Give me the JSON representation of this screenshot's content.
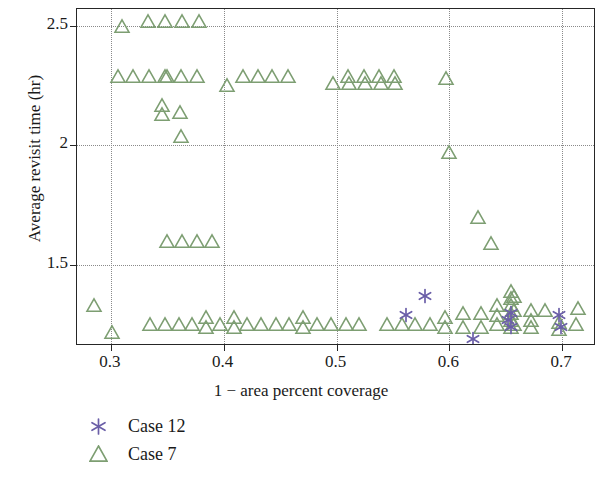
{
  "chart_data": {
    "type": "scatter",
    "title": "",
    "xlabel": "1 − area percent coverage",
    "ylabel": "Average revisit time (hr)",
    "xlim": [
      0.27,
      0.73
    ],
    "ylim": [
      1.16,
      2.57
    ],
    "xticks": [
      "0.3",
      "0.4",
      "0.5",
      "0.6",
      "0.7"
    ],
    "xtick_values": [
      0.3,
      0.4,
      0.5,
      0.6,
      0.7
    ],
    "yticks": [
      "1.5",
      "2",
      "2.5"
    ],
    "ytick_values": [
      1.5,
      2.0,
      2.5
    ],
    "grid": true,
    "grid_style": "dotted",
    "legend_position": "below-left",
    "colors": {
      "case12": "#6b5fa8",
      "case7": "#7d9e72",
      "axis": "#262626",
      "grid": "#8a8a8a"
    },
    "series": [
      {
        "name": "Case 12",
        "marker": "asterisk",
        "color": "#6b5fa8",
        "points": [
          [
            0.562,
            1.29
          ],
          [
            0.578,
            1.37
          ],
          [
            0.621,
            1.19
          ],
          [
            0.652,
            1.27
          ],
          [
            0.655,
            1.24
          ],
          [
            0.655,
            1.3
          ],
          [
            0.697,
            1.29
          ],
          [
            0.699,
            1.24
          ]
        ]
      },
      {
        "name": "Case 7",
        "marker": "triangle",
        "color": "#7d9e72",
        "points": [
          [
            0.31,
            2.5
          ],
          [
            0.333,
            2.52
          ],
          [
            0.348,
            2.52
          ],
          [
            0.363,
            2.52
          ],
          [
            0.378,
            2.52
          ],
          [
            0.306,
            2.29
          ],
          [
            0.32,
            2.29
          ],
          [
            0.334,
            2.29
          ],
          [
            0.348,
            2.29
          ],
          [
            0.35,
            2.29
          ],
          [
            0.362,
            2.29
          ],
          [
            0.376,
            2.29
          ],
          [
            0.403,
            2.25
          ],
          [
            0.417,
            2.29
          ],
          [
            0.43,
            2.29
          ],
          [
            0.443,
            2.29
          ],
          [
            0.457,
            2.29
          ],
          [
            0.497,
            2.26
          ],
          [
            0.51,
            2.29
          ],
          [
            0.511,
            2.26
          ],
          [
            0.524,
            2.29
          ],
          [
            0.525,
            2.26
          ],
          [
            0.538,
            2.29
          ],
          [
            0.539,
            2.26
          ],
          [
            0.551,
            2.29
          ],
          [
            0.552,
            2.26
          ],
          [
            0.597,
            2.28
          ],
          [
            0.345,
            2.17
          ],
          [
            0.345,
            2.13
          ],
          [
            0.361,
            2.14
          ],
          [
            0.362,
            2.04
          ],
          [
            0.35,
            1.6
          ],
          [
            0.363,
            1.6
          ],
          [
            0.376,
            1.6
          ],
          [
            0.39,
            1.6
          ],
          [
            0.6,
            1.97
          ],
          [
            0.625,
            1.7
          ],
          [
            0.637,
            1.59
          ],
          [
            0.285,
            1.33
          ],
          [
            0.301,
            1.22
          ],
          [
            0.335,
            1.25
          ],
          [
            0.348,
            1.25
          ],
          [
            0.36,
            1.25
          ],
          [
            0.372,
            1.25
          ],
          [
            0.384,
            1.28
          ],
          [
            0.384,
            1.24
          ],
          [
            0.397,
            1.25
          ],
          [
            0.409,
            1.28
          ],
          [
            0.409,
            1.24
          ],
          [
            0.421,
            1.25
          ],
          [
            0.433,
            1.25
          ],
          [
            0.446,
            1.25
          ],
          [
            0.458,
            1.25
          ],
          [
            0.47,
            1.28
          ],
          [
            0.47,
            1.24
          ],
          [
            0.483,
            1.25
          ],
          [
            0.495,
            1.25
          ],
          [
            0.508,
            1.25
          ],
          [
            0.52,
            1.25
          ],
          [
            0.545,
            1.25
          ],
          [
            0.558,
            1.25
          ],
          [
            0.57,
            1.25
          ],
          [
            0.583,
            1.25
          ],
          [
            0.596,
            1.28
          ],
          [
            0.596,
            1.24
          ],
          [
            0.612,
            1.3
          ],
          [
            0.612,
            1.24
          ],
          [
            0.628,
            1.3
          ],
          [
            0.628,
            1.24
          ],
          [
            0.642,
            1.33
          ],
          [
            0.642,
            1.29
          ],
          [
            0.642,
            1.25
          ],
          [
            0.655,
            1.39
          ],
          [
            0.655,
            1.36
          ],
          [
            0.655,
            1.33
          ],
          [
            0.655,
            1.3
          ],
          [
            0.655,
            1.27
          ],
          [
            0.655,
            1.24
          ],
          [
            0.657,
            1.37
          ],
          [
            0.657,
            1.31
          ],
          [
            0.657,
            1.25
          ],
          [
            0.672,
            1.31
          ],
          [
            0.672,
            1.27
          ],
          [
            0.672,
            1.24
          ],
          [
            0.685,
            1.31
          ],
          [
            0.697,
            1.26
          ],
          [
            0.697,
            1.23
          ],
          [
            0.714,
            1.32
          ],
          [
            0.712,
            1.25
          ]
        ]
      }
    ]
  },
  "legend": {
    "items": [
      {
        "label": "Case 12",
        "marker": "asterisk",
        "color": "#6b5fa8"
      },
      {
        "label": "Case 7",
        "marker": "triangle",
        "color": "#7d9e72"
      }
    ]
  }
}
